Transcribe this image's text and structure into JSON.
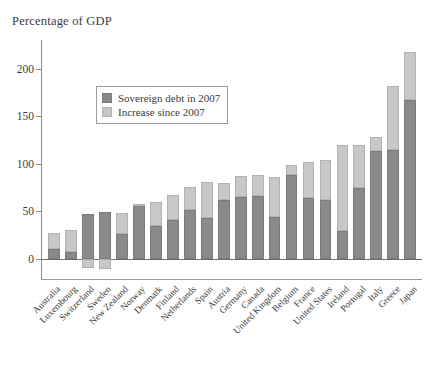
{
  "chart_data": {
    "type": "bar",
    "title": "Percentage of GDP",
    "subtitle": "",
    "xlabel": "",
    "ylabel": "",
    "stacked": true,
    "grid": false,
    "legend_position": "inside-upper-left",
    "ylim": [
      -10,
      230
    ],
    "yticks": [
      0,
      50,
      100,
      150,
      200
    ],
    "ytick_labels": [
      "0",
      "50",
      "100",
      "150",
      "200"
    ],
    "colors": {
      "sovereign_debt_2007": "#8a8a8a",
      "increase_since_2007": "#c8c8c8",
      "axis": "#8e8e8e",
      "text": "#3c3c3c"
    },
    "categories": [
      "Australia",
      "Luxembourg",
      "Switzerland",
      "Sweden",
      "New Zealand",
      "Norway",
      "Denmark",
      "Finland",
      "Netherlands",
      "Spain",
      "Austria",
      "Germany",
      "Canada",
      "United Kingdom",
      "Belgium",
      "France",
      "United States",
      "Ireland",
      "Portugal",
      "Italy",
      "Greece",
      "Japan"
    ],
    "series": [
      {
        "name": "Sovereign debt in 2007",
        "color": "#8a8a8a",
        "values": [
          10,
          7,
          47,
          49,
          26,
          57,
          35,
          41,
          52,
          43,
          62,
          65,
          66,
          44,
          88,
          64,
          62,
          29,
          75,
          114,
          115,
          167
        ]
      },
      {
        "name": "Increase since 2007",
        "color": "#c8c8c8",
        "values": [
          17,
          24,
          -9,
          -11,
          22,
          1,
          25,
          26,
          24,
          38,
          18,
          22,
          22,
          42,
          11,
          38,
          42,
          91,
          45,
          14,
          67,
          51
        ]
      }
    ],
    "totals": [
      27,
      31,
      38,
      38,
      48,
      58,
      60,
      67,
      76,
      81,
      80,
      87,
      88,
      86,
      99,
      102,
      104,
      120,
      120,
      128,
      182,
      218
    ]
  },
  "legend": {
    "items": [
      {
        "label": "Sovereign debt in 2007",
        "swatch": "base"
      },
      {
        "label": "Increase since 2007",
        "swatch": "incr"
      }
    ]
  }
}
